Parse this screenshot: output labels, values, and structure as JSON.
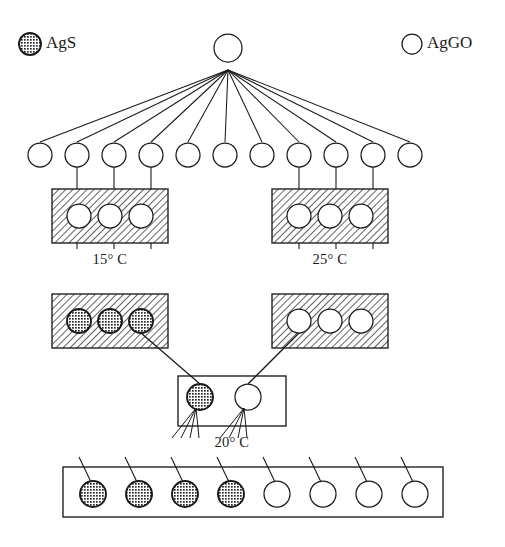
{
  "figure": {
    "background": "#ffffff",
    "stroke_color": "#1a1a1a"
  },
  "legend": {
    "position": "top",
    "items": [
      {
        "id": "ags",
        "label": "AgS",
        "marker": "filled-hatched-circle",
        "x": 30,
        "y": 44,
        "r": 11
      },
      {
        "id": "aggo",
        "label": "AgGO",
        "marker": "open-circle",
        "x": 412,
        "y": 44,
        "r": 10
      }
    ]
  },
  "root": {
    "label": "",
    "marker": "open-circle",
    "cx": 228,
    "cy": 48,
    "r": 14,
    "fan_origin": {
      "x": 228,
      "y": 70
    }
  },
  "rows": [
    {
      "id": "row-tips",
      "kind": "circle-row",
      "cy": 155,
      "r": 12,
      "marker": "open-circle",
      "count": 11,
      "x_positions": [
        40,
        77,
        114,
        151,
        188,
        225,
        262,
        299,
        336,
        373,
        410
      ],
      "stem_indices": [
        1,
        2,
        3,
        7,
        8,
        9
      ]
    },
    {
      "id": "row-boxes-a",
      "kind": "box-row",
      "boxes": [
        {
          "id": "box-15c",
          "label": "15° C",
          "fill": "hatched",
          "x": 52,
          "y": 189,
          "w": 116,
          "h": 54,
          "label_x": 110,
          "label_y": 261,
          "circles": [
            {
              "marker": "open-circle",
              "cx": 79,
              "cy": 216,
              "r": 12
            },
            {
              "marker": "open-circle",
              "cx": 110,
              "cy": 216,
              "r": 12
            },
            {
              "marker": "open-circle",
              "cx": 141,
              "cy": 216,
              "r": 12
            }
          ]
        },
        {
          "id": "box-25c",
          "label": "25° C",
          "fill": "hatched",
          "x": 272,
          "y": 189,
          "w": 116,
          "h": 54,
          "label_x": 330,
          "label_y": 261,
          "circles": [
            {
              "marker": "open-circle",
              "cx": 299,
              "cy": 216,
              "r": 12
            },
            {
              "marker": "open-circle",
              "cx": 330,
              "cy": 216,
              "r": 12
            },
            {
              "marker": "open-circle",
              "cx": 361,
              "cy": 216,
              "r": 12
            }
          ]
        }
      ]
    },
    {
      "id": "row-boxes-b",
      "kind": "box-row",
      "boxes": [
        {
          "id": "box-left-ags",
          "label": "",
          "fill": "hatched",
          "x": 52,
          "y": 294,
          "w": 116,
          "h": 54,
          "circles": [
            {
              "marker": "filled-hatched-circle",
              "cx": 79,
              "cy": 321,
              "r": 12
            },
            {
              "marker": "filled-hatched-circle",
              "cx": 110,
              "cy": 321,
              "r": 12
            },
            {
              "marker": "filled-hatched-circle",
              "cx": 141,
              "cy": 321,
              "r": 12
            }
          ]
        },
        {
          "id": "box-right-aggo",
          "label": "",
          "fill": "hatched",
          "x": 272,
          "y": 294,
          "w": 116,
          "h": 54,
          "circles": [
            {
              "marker": "open-circle",
              "cx": 299,
              "cy": 321,
              "r": 12
            },
            {
              "marker": "open-circle",
              "cx": 330,
              "cy": 321,
              "r": 12
            },
            {
              "marker": "open-circle",
              "cx": 361,
              "cy": 321,
              "r": 12
            }
          ]
        }
      ]
    },
    {
      "id": "row-box-20c",
      "kind": "box-row",
      "boxes": [
        {
          "id": "box-20c",
          "label": "20° C",
          "fill": "white",
          "x": 178,
          "y": 376,
          "w": 108,
          "h": 50,
          "label_x": 232,
          "label_y": 444,
          "circles": [
            {
              "marker": "filled-hatched-circle",
              "cx": 200,
              "cy": 397,
              "r": 13
            },
            {
              "marker": "open-circle",
              "cx": 248,
              "cy": 397,
              "r": 13
            }
          ]
        }
      ]
    },
    {
      "id": "row-bottom",
      "kind": "box-row",
      "boxes": [
        {
          "id": "box-bottom",
          "label": "",
          "fill": "white",
          "x": 63,
          "y": 467,
          "w": 380,
          "h": 50,
          "circles": [
            {
              "marker": "filled-hatched-circle",
              "cx": 93,
              "cy": 494,
              "r": 13
            },
            {
              "marker": "filled-hatched-circle",
              "cx": 139,
              "cy": 494,
              "r": 13
            },
            {
              "marker": "filled-hatched-circle",
              "cx": 185,
              "cy": 494,
              "r": 13
            },
            {
              "marker": "filled-hatched-circle",
              "cx": 231,
              "cy": 494,
              "r": 13
            },
            {
              "marker": "open-circle",
              "cx": 277,
              "cy": 494,
              "r": 13
            },
            {
              "marker": "open-circle",
              "cx": 323,
              "cy": 494,
              "r": 13
            },
            {
              "marker": "open-circle",
              "cx": 369,
              "cy": 494,
              "r": 13
            },
            {
              "marker": "open-circle",
              "cx": 415,
              "cy": 494,
              "r": 13
            }
          ]
        }
      ]
    }
  ],
  "connectors": {
    "ags_branch": {
      "from": {
        "x": 141,
        "y": 333
      },
      "to": {
        "x": 200,
        "y": 384
      }
    },
    "aggo_branch": {
      "from": {
        "x": 299,
        "y": 333
      },
      "to": {
        "x": 248,
        "y": 384
      }
    }
  },
  "labels": {
    "temp_15": "15° C",
    "temp_25": "25° C",
    "temp_20": "20° C",
    "legend_ags": "AgS",
    "legend_aggo": "AgGO"
  }
}
